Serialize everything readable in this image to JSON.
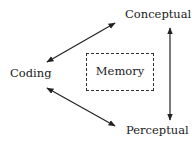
{
  "diagram": {
    "nodes": {
      "conceptual": {
        "label": "Conceptual"
      },
      "coding": {
        "label": "Coding"
      },
      "perceptual": {
        "label": "Perceptual"
      },
      "memory": {
        "label": "Memory",
        "style": "dashed-box"
      }
    },
    "edges": [
      {
        "from": "coding",
        "to": "conceptual",
        "type": "bidirectional-arrow"
      },
      {
        "from": "coding",
        "to": "perceptual",
        "type": "bidirectional-arrow"
      },
      {
        "from": "conceptual",
        "to": "perceptual",
        "type": "bidirectional-arrow"
      }
    ],
    "colors": {
      "stroke": "#222222",
      "background": "#ffffff"
    }
  }
}
